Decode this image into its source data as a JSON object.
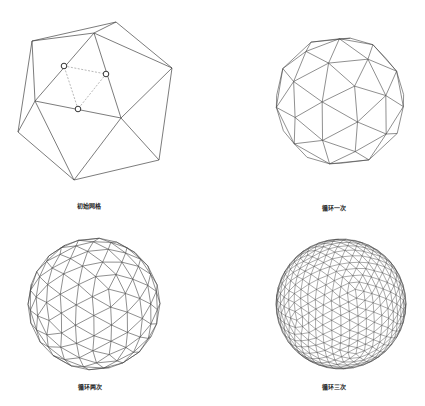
{
  "panels": [
    {
      "id": "initial",
      "label": "初始网格",
      "label_pos": [
        89,
        205
      ],
      "type": "icosahedron",
      "vertices": {
        "A": [
          116,
          22
        ],
        "B": [
          32,
          41
        ],
        "C": [
          94,
          33
        ],
        "D": [
          172,
          68
        ],
        "E": [
          35,
          101
        ],
        "F": [
          121,
          118
        ],
        "G": [
          18,
          132
        ],
        "H": [
          159,
          160
        ],
        "I": [
          74,
          180
        ]
      },
      "edges": [
        [
          "B",
          "A"
        ],
        [
          "C",
          "A"
        ],
        [
          "B",
          "C"
        ],
        [
          "A",
          "D"
        ],
        [
          "C",
          "D"
        ],
        [
          "B",
          "E"
        ],
        [
          "B",
          "G"
        ],
        [
          "C",
          "E"
        ],
        [
          "C",
          "F"
        ],
        [
          "D",
          "F"
        ],
        [
          "D",
          "H"
        ],
        [
          "E",
          "F"
        ],
        [
          "E",
          "G"
        ],
        [
          "E",
          "I"
        ],
        [
          "F",
          "I"
        ],
        [
          "F",
          "H"
        ],
        [
          "G",
          "I"
        ],
        [
          "I",
          "H"
        ]
      ],
      "midpoints": [
        [
          64,
          66
        ],
        [
          106,
          74
        ],
        [
          78,
          109
        ]
      ],
      "dashed_edges": [
        [
          0,
          1
        ],
        [
          1,
          2
        ],
        [
          2,
          0
        ]
      ]
    },
    {
      "id": "loop1",
      "label": "循环一次",
      "label_pos": [
        334,
        207
      ],
      "type": "icosphere",
      "subdivisions": 1,
      "center": [
        340,
        101
      ],
      "radius": 66,
      "rotation": [
        0.35,
        0.25,
        0.1
      ]
    },
    {
      "id": "loop2",
      "label": "循环两次",
      "label_pos": [
        90,
        386
      ],
      "type": "icosphere",
      "subdivisions": 2,
      "center": [
        94,
        304
      ],
      "radius": 66,
      "rotation": [
        0.35,
        0.25,
        0.1
      ]
    },
    {
      "id": "loop3",
      "label": "循环三次",
      "label_pos": [
        334,
        386
      ],
      "type": "icosphere",
      "subdivisions": 3,
      "center": [
        341,
        304
      ],
      "radius": 65,
      "rotation": [
        0.35,
        0.25,
        0.1
      ]
    }
  ],
  "colors": {
    "line": "#444444",
    "dashed": "#999999",
    "circle": "#333333",
    "background": "#ffffff"
  }
}
